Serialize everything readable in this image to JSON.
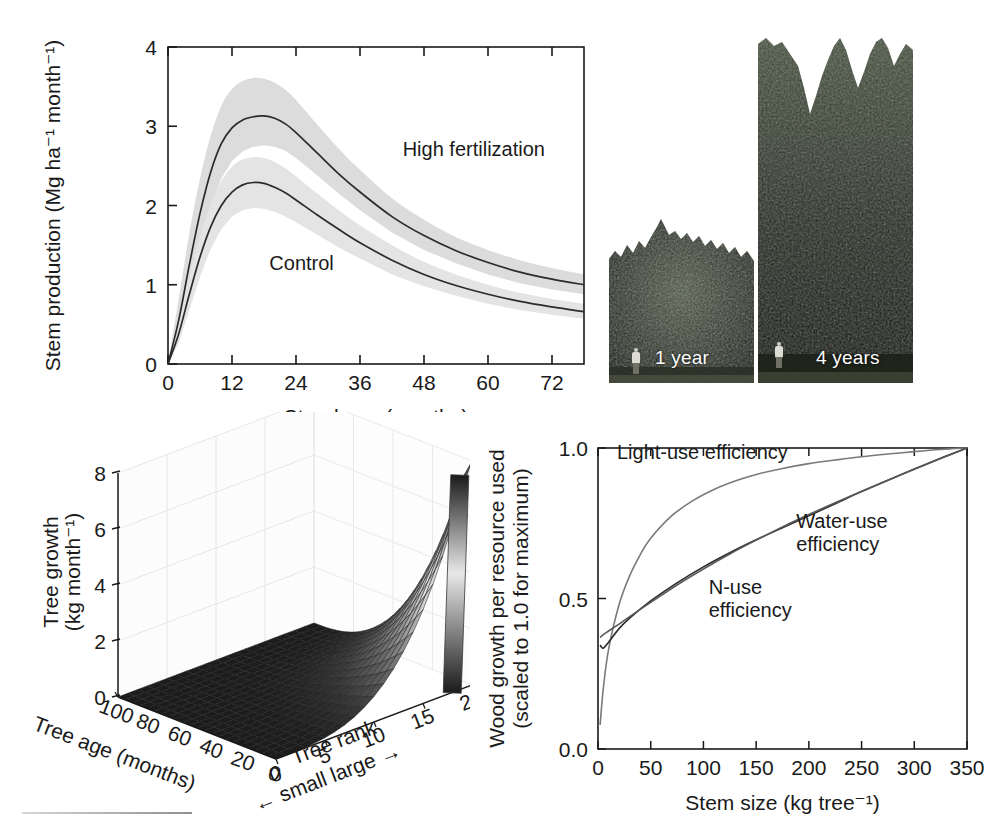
{
  "figure": {
    "panels": [
      "stem-production",
      "stand-photographs",
      "tree-growth-surface",
      "resource-use-efficiency"
    ]
  },
  "photos": {
    "young": {
      "caption": "1 year",
      "person_icon": "person-silhouette-icon"
    },
    "old": {
      "caption": "4 years",
      "person_icon": "person-silhouette-icon"
    }
  },
  "chart_data": [
    {
      "id": "stem-production",
      "type": "line",
      "title": "",
      "xlabel": "Stand age (months)",
      "ylabel": "Stem production (Mg ha⁻¹ month⁻¹)",
      "xlim": [
        0,
        78
      ],
      "ylim": [
        0,
        4
      ],
      "xticks": [
        0,
        12,
        24,
        36,
        48,
        60,
        72
      ],
      "yticks": [
        0,
        1,
        2,
        3,
        4
      ],
      "grid": false,
      "legend_position": "inline-annotation",
      "series": [
        {
          "name": "High fertilization",
          "label_x": 44,
          "label_y": 2.62,
          "color": "#2b2b2b",
          "band_color": "#dcdcdc",
          "x": [
            0,
            2,
            4,
            6,
            8,
            10,
            12,
            14,
            16,
            18,
            20,
            22,
            24,
            28,
            32,
            36,
            42,
            48,
            54,
            60,
            66,
            72,
            78
          ],
          "y": [
            0.0,
            0.55,
            1.25,
            1.9,
            2.42,
            2.78,
            2.98,
            3.08,
            3.12,
            3.13,
            3.1,
            3.03,
            2.92,
            2.66,
            2.4,
            2.17,
            1.86,
            1.62,
            1.43,
            1.28,
            1.16,
            1.07,
            1.0
          ],
          "ylow": [
            0.0,
            0.3,
            0.88,
            1.48,
            1.98,
            2.34,
            2.56,
            2.68,
            2.74,
            2.76,
            2.74,
            2.69,
            2.6,
            2.38,
            2.15,
            1.94,
            1.66,
            1.44,
            1.27,
            1.13,
            1.02,
            0.94,
            0.88
          ],
          "yhigh": [
            0.0,
            0.82,
            1.65,
            2.34,
            2.88,
            3.26,
            3.47,
            3.57,
            3.61,
            3.6,
            3.55,
            3.46,
            3.33,
            3.02,
            2.72,
            2.45,
            2.09,
            1.82,
            1.6,
            1.44,
            1.31,
            1.21,
            1.13
          ]
        },
        {
          "name": "Control",
          "label_x": 19,
          "label_y": 1.18,
          "color": "#2b2b2b",
          "band_color": "#e4e4e4",
          "x": [
            0,
            2,
            4,
            6,
            8,
            10,
            12,
            14,
            16,
            18,
            20,
            22,
            24,
            28,
            32,
            36,
            42,
            48,
            54,
            60,
            66,
            72,
            78
          ],
          "y": [
            0.0,
            0.38,
            0.88,
            1.35,
            1.73,
            2.0,
            2.17,
            2.26,
            2.29,
            2.28,
            2.23,
            2.16,
            2.07,
            1.88,
            1.7,
            1.53,
            1.31,
            1.13,
            0.99,
            0.88,
            0.79,
            0.72,
            0.66
          ],
          "ylow": [
            0.0,
            0.26,
            0.68,
            1.1,
            1.45,
            1.7,
            1.86,
            1.94,
            1.97,
            1.96,
            1.92,
            1.86,
            1.79,
            1.63,
            1.47,
            1.33,
            1.13,
            0.98,
            0.86,
            0.76,
            0.68,
            0.62,
            0.57
          ],
          "yhigh": [
            0.0,
            0.52,
            1.1,
            1.61,
            2.02,
            2.31,
            2.49,
            2.58,
            2.61,
            2.6,
            2.55,
            2.47,
            2.37,
            2.15,
            1.94,
            1.75,
            1.5,
            1.29,
            1.13,
            1.0,
            0.9,
            0.82,
            0.76
          ]
        }
      ]
    },
    {
      "id": "tree-growth-surface",
      "type": "surface",
      "title": "",
      "zlabel": "Tree growth (kg month⁻¹)",
      "xlabel": "Tree age (months)",
      "ylabel": "Tree rank",
      "ylabel_note": "← small  large →",
      "xticks": [
        100,
        80,
        60,
        40,
        20,
        0
      ],
      "yticks": [
        0,
        5,
        10,
        15,
        20
      ],
      "zticks": [
        0,
        2,
        4,
        6,
        8
      ],
      "zlim": [
        0,
        8
      ],
      "colorbar": {
        "present": true,
        "low_color": "#1a1a1a",
        "mid_color": "#e8e8e8",
        "high_color": "#1a1a1a"
      },
      "description": "Tree growth rises steeply for the largest ranks at the youngest ages; near-zero for small ranks and old ages.",
      "corner_zero_labels": [
        "0",
        "0"
      ]
    },
    {
      "id": "resource-use-efficiency",
      "type": "line",
      "title": "",
      "xlabel": "Stem size (kg tree⁻¹)",
      "ylabel": "Wood growth per resource used (scaled to 1.0 for maximum)",
      "xlim": [
        0,
        350
      ],
      "ylim": [
        0,
        1
      ],
      "xticks": [
        0,
        50,
        100,
        150,
        200,
        250,
        300,
        350
      ],
      "yticks": [
        0.0,
        0.5,
        1.0
      ],
      "ytick_labels": [
        "0.0",
        "0.5",
        "1.0"
      ],
      "grid": false,
      "legend_position": "inline-annotation",
      "series": [
        {
          "name": "Light-use efficiency",
          "label_x": 18,
          "label_y": 0.965,
          "label_color": "#6b6b6b",
          "color": "#7a7a7a",
          "x": [
            2,
            5,
            10,
            20,
            30,
            40,
            50,
            70,
            90,
            110,
            130,
            150,
            175,
            200,
            225,
            250,
            275,
            300,
            325,
            350
          ],
          "y": [
            0.08,
            0.2,
            0.33,
            0.48,
            0.575,
            0.645,
            0.7,
            0.775,
            0.825,
            0.862,
            0.89,
            0.912,
            0.932,
            0.948,
            0.96,
            0.971,
            0.98,
            0.988,
            0.995,
            1.0
          ]
        },
        {
          "name": "Water-use efficiency",
          "label_x": 188,
          "label_y": 0.735,
          "label_color": "#1a1a1a",
          "color": "#2b2b2b",
          "x": [
            2,
            5,
            10,
            20,
            30,
            50,
            75,
            100,
            125,
            150,
            175,
            200,
            225,
            250,
            275,
            300,
            325,
            350
          ],
          "y": [
            0.345,
            0.335,
            0.355,
            0.4,
            0.435,
            0.492,
            0.552,
            0.605,
            0.652,
            0.695,
            0.735,
            0.775,
            0.815,
            0.855,
            0.893,
            0.93,
            0.966,
            1.0
          ]
        },
        {
          "name": "N-use efficiency",
          "label_x": 105,
          "label_y": 0.515,
          "label_color": "#6b6b6b",
          "color": "#5a5a5a",
          "x": [
            2,
            5,
            10,
            20,
            30,
            50,
            75,
            100,
            125,
            150,
            175,
            200,
            225,
            250,
            275,
            300,
            325,
            350
          ],
          "y": [
            0.37,
            0.38,
            0.392,
            0.415,
            0.44,
            0.487,
            0.545,
            0.598,
            0.648,
            0.694,
            0.738,
            0.779,
            0.818,
            0.856,
            0.893,
            0.929,
            0.965,
            1.0
          ]
        }
      ]
    }
  ]
}
